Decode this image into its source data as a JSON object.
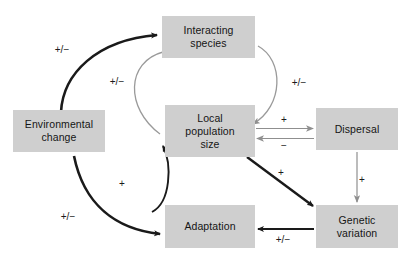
{
  "diagram": {
    "background_color": "#ffffff",
    "node_fill_color": "#cfcfcf",
    "node_text_color": "#151515",
    "dark_edge_color": "#1a1a1a",
    "light_edge_color": "#9a9a9a",
    "nodes": [
      {
        "id": "environmental-change",
        "label": "Environmental\nchange",
        "x": 13,
        "y": 110,
        "w": 92,
        "h": 42
      },
      {
        "id": "interacting-species",
        "label": "Interacting\nspecies",
        "x": 162,
        "y": 16,
        "w": 93,
        "h": 42
      },
      {
        "id": "local-population-size",
        "label": "Local\npopulation\nsize",
        "x": 165,
        "y": 105,
        "w": 90,
        "h": 52
      },
      {
        "id": "dispersal",
        "label": "Dispersal",
        "x": 316,
        "y": 108,
        "w": 82,
        "h": 42
      },
      {
        "id": "adaptation",
        "label": "Adaptation",
        "x": 165,
        "y": 205,
        "w": 90,
        "h": 43
      },
      {
        "id": "genetic-variation",
        "label": "Genetic\nvariation",
        "x": 316,
        "y": 205,
        "w": 82,
        "h": 43
      }
    ],
    "edges": [
      {
        "id": "env-change-to-interacting-species",
        "from": "environmental-change",
        "to": "interacting-species",
        "sign": "+/−",
        "label_x": 62,
        "label_y": 50,
        "style": "dark-thick-curve"
      },
      {
        "id": "interacting-species-to-local-population-left",
        "from": "interacting-species",
        "to": "local-population-size",
        "sign": "+/−",
        "label_x": 117,
        "label_y": 82,
        "style": "light-curve"
      },
      {
        "id": "interacting-species-to-local-population-right",
        "from": "interacting-species",
        "to": "local-population-size",
        "sign": "+/−",
        "label_x": 299,
        "label_y": 83,
        "style": "light-curve"
      },
      {
        "id": "local-population-to-dispersal",
        "from": "local-population-size",
        "to": "dispersal",
        "sign": "+",
        "label_x": 284,
        "label_y": 120,
        "style": "light-straight"
      },
      {
        "id": "dispersal-to-local-population",
        "from": "dispersal",
        "to": "local-population-size",
        "sign": "−",
        "label_x": 284,
        "label_y": 146,
        "style": "light-straight"
      },
      {
        "id": "adaptation-to-local-population",
        "from": "adaptation",
        "to": "local-population-size",
        "sign": "+",
        "label_x": 122,
        "label_y": 184,
        "style": "dark-curve"
      },
      {
        "id": "env-change-to-adaptation",
        "from": "environmental-change",
        "to": "adaptation",
        "sign": "+/−",
        "label_x": 68,
        "label_y": 217,
        "style": "dark-thick-curve"
      },
      {
        "id": "local-population-to-genetic-variation",
        "from": "local-population-size",
        "to": "genetic-variation",
        "sign": "+",
        "label_x": 281,
        "label_y": 173,
        "style": "dark-straight"
      },
      {
        "id": "dispersal-to-genetic-variation",
        "from": "dispersal",
        "to": "genetic-variation",
        "sign": "+",
        "label_x": 362,
        "label_y": 180,
        "style": "light-straight"
      },
      {
        "id": "genetic-variation-to-adaptation",
        "from": "genetic-variation",
        "to": "adaptation",
        "sign": "+/−",
        "label_x": 283,
        "label_y": 240,
        "style": "dark-straight"
      }
    ]
  }
}
